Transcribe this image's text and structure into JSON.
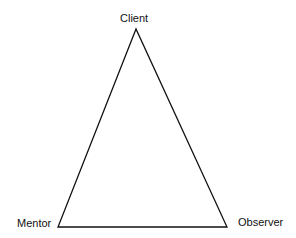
{
  "diagram": {
    "type": "triangle",
    "stroke_color": "#111111",
    "vertices": {
      "top": {
        "label": "Client",
        "x": 136,
        "y": 29
      },
      "bottom_left": {
        "label": "Mentor",
        "x": 58,
        "y": 227
      },
      "bottom_right": {
        "label": "Observer",
        "x": 227,
        "y": 227
      }
    }
  }
}
